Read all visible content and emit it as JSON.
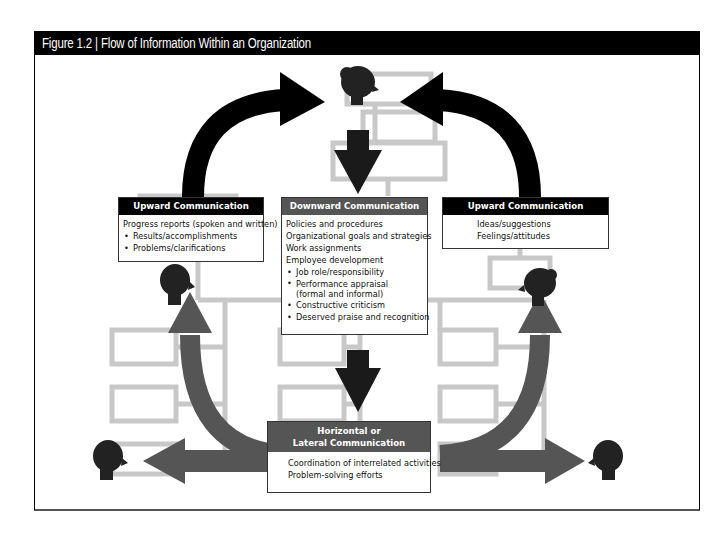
{
  "figure": {
    "title": "Figure 1.2  |  Flow of Information Within an Organization"
  },
  "boxes": {
    "upward_left": {
      "header": "Upward Communication",
      "lines": [
        {
          "text": "Progress reports (spoken and written)",
          "bullet": false
        },
        {
          "text": "Results/accomplishments",
          "bullet": true
        },
        {
          "text": "Problems/clarifications",
          "bullet": true
        }
      ]
    },
    "downward": {
      "header": "Downward Communication",
      "lines": [
        {
          "text": "Policies and procedures",
          "bullet": false
        },
        {
          "text": "Organizational goals and strategies",
          "bullet": false
        },
        {
          "text": "Work assignments",
          "bullet": false
        },
        {
          "text": "Employee development",
          "bullet": false
        },
        {
          "text": "Job role/responsibility",
          "bullet": true
        },
        {
          "text": "Performance appraisal",
          "bullet": true
        },
        {
          "text": "(formal and informal)",
          "bullet": false,
          "indent": true
        },
        {
          "text": "Constructive criticism",
          "bullet": true
        },
        {
          "text": "Deserved praise and recognition",
          "bullet": true
        }
      ]
    },
    "upward_right": {
      "header": "Upward Communication",
      "lines": [
        {
          "text": "Ideas/suggestions",
          "bullet": false
        },
        {
          "text": "Feelings/attitudes",
          "bullet": false
        }
      ]
    },
    "horizontal": {
      "header_line1": "Horizontal or",
      "header_line2": "Lateral Communication",
      "lines": [
        {
          "text": "Coordination of interrelated activities",
          "bullet": false
        },
        {
          "text": "Problem-solving efforts",
          "bullet": false
        }
      ]
    }
  },
  "colors": {
    "title_bg": "#000000",
    "upward_arrow": "#000000",
    "downward_arrow": "#1a1a1a",
    "horizontal_arrow": "#555555",
    "org_box_gray": "#c4c4c4",
    "header_black": "#000000",
    "header_gray": "#555555"
  },
  "icons": [
    "female-head-icon",
    "male-head-icon"
  ]
}
